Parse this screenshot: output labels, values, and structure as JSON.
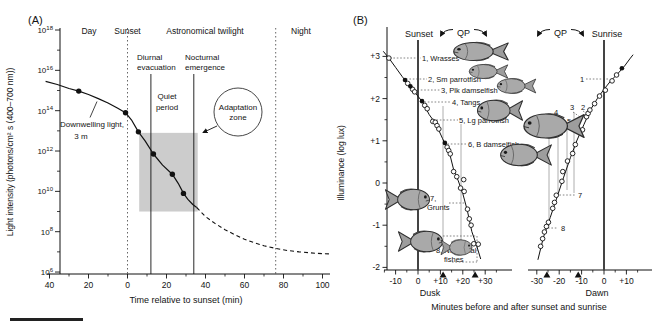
{
  "figure": {
    "panel_a_tag": "(A)",
    "panel_b_tag": "(B)"
  },
  "chart_data": [
    {
      "panel": "A",
      "type": "line",
      "xlabel": "Time relative to sunset (min)",
      "ylabel": "Light intensity (photons/cm² s (400–700 nm))",
      "x_ticks": {
        "values": [
          -40,
          -20,
          0,
          20,
          40,
          60,
          80,
          100
        ],
        "labels": [
          "40",
          "20",
          "0",
          "20",
          "40",
          "60",
          "80",
          "100"
        ],
        "minor": [
          -30,
          -10,
          10,
          30,
          50,
          70,
          90
        ]
      },
      "y_ticks": {
        "base": "10",
        "exponents": [
          18,
          16,
          14,
          12,
          10,
          8,
          6
        ],
        "minor_exponents": [
          17,
          15,
          13,
          11,
          9,
          7
        ]
      },
      "xlim": [
        -44,
        104
      ],
      "ylim_log10": [
        6,
        18
      ],
      "top_band_labels": {
        "day": "Day",
        "sunset": "Sunset",
        "astronomical_twilight": "Astronomical twilight",
        "night": "Night"
      },
      "boundaries": {
        "sunset_dotted_t": 0,
        "night_dotted_t": 76,
        "diurnal_evacuation_line_t": 12,
        "nocturnal_emergence_line_t": 34
      },
      "quiet_period_box": {
        "t_range": [
          6,
          36
        ],
        "log10_range": [
          9.0,
          12.9
        ]
      },
      "series": [
        {
          "name": "Downwelling light, 3 m (measured)",
          "style": "solid",
          "points": [
            [
              -42,
              15.45
            ],
            [
              -36,
              15.3
            ],
            [
              -30,
              15.1
            ],
            [
              -25,
              14.97
            ],
            [
              -20,
              14.8
            ],
            [
              -15,
              14.6
            ],
            [
              -10,
              14.38
            ],
            [
              -5,
              14.12
            ],
            [
              -1,
              13.9
            ],
            [
              2,
              13.55
            ],
            [
              5.6,
              12.95
            ],
            [
              9,
              12.5
            ],
            [
              13.3,
              11.85
            ],
            [
              18,
              11.3
            ],
            [
              23,
              10.85
            ],
            [
              26,
              10.4
            ],
            [
              28.7,
              9.9
            ],
            [
              31,
              9.6
            ],
            [
              33.5,
              9.35
            ],
            [
              35.5,
              9.2
            ]
          ]
        },
        {
          "name": "extrapolated",
          "style": "dashed",
          "points": [
            [
              35.5,
              9.2
            ],
            [
              40,
              8.75
            ],
            [
              45,
              8.4
            ],
            [
              50,
              8.1
            ],
            [
              55,
              7.85
            ],
            [
              60,
              7.63
            ],
            [
              65,
              7.45
            ],
            [
              70,
              7.3
            ],
            [
              76,
              7.17
            ],
            [
              82,
              7.07
            ],
            [
              88,
              7.0
            ],
            [
              94,
              6.95
            ],
            [
              100,
              6.91
            ],
            [
              103.5,
              6.9
            ]
          ]
        },
        {
          "name": "measurement points",
          "style": "filled-dots",
          "points": [
            [
              -25,
              14.97
            ],
            [
              -1,
              13.9
            ],
            [
              5.6,
              12.95
            ],
            [
              13.3,
              11.85
            ],
            [
              23,
              10.85
            ],
            [
              28.7,
              9.9
            ]
          ]
        }
      ],
      "annotations": {
        "diurnal_evacuation": [
          "Diurnal",
          "evacuation"
        ],
        "nocturnal_emergence": [
          "Nocturnal",
          "emergence"
        ],
        "quiet_period": [
          "Quiet",
          "period"
        ],
        "adaptation_zone": [
          "Adaptation",
          "zone"
        ],
        "downwelling": [
          "Downwelling light,",
          "3 m"
        ]
      }
    },
    {
      "panel": "B",
      "type": "scatter",
      "ylabel": "Illuminance (log lux)",
      "xlabel": "Minutes before and after sunset and sunrise",
      "y_ticks": {
        "values": [
          3,
          2,
          1,
          0,
          -1,
          -2
        ],
        "labels": [
          "+3",
          "+2",
          "+1",
          "0",
          "-1",
          "-2"
        ],
        "minor": [
          2.5,
          1.5,
          0.5,
          -0.5,
          -1.5
        ]
      },
      "dusk": {
        "label": "Dusk",
        "header": "Sunset",
        "qp_label": "QP",
        "x_ticks": {
          "values": [
            -10,
            0,
            10,
            20,
            30
          ],
          "labels": [
            "-10",
            "0",
            "+10",
            "+20",
            "+30"
          ],
          "minor": [
            -15,
            -5,
            5,
            15,
            25,
            35
          ]
        },
        "curve": [
          [
            -15.5,
            3.12
          ],
          [
            -13,
            2.96
          ],
          [
            -10,
            2.74
          ],
          [
            -7,
            2.52
          ],
          [
            -4,
            2.32
          ],
          [
            -1,
            2.12
          ],
          [
            2,
            1.92
          ],
          [
            5,
            1.62
          ],
          [
            8,
            1.4
          ],
          [
            11,
            1.05
          ],
          [
            14,
            0.72
          ],
          [
            16,
            0.3
          ],
          [
            18,
            0.05
          ],
          [
            20,
            -0.25
          ],
          [
            22,
            -0.65
          ],
          [
            24,
            -1.15
          ],
          [
            26,
            -1.45
          ],
          [
            28,
            -1.8
          ]
        ],
        "open_points": [
          [
            -13,
            2.96
          ],
          [
            -4.6,
            2.36
          ],
          [
            -2.4,
            2.22
          ],
          [
            -1.5,
            2.16
          ],
          [
            3,
            1.84
          ],
          [
            4.1,
            1.76
          ],
          [
            6.6,
            1.46
          ],
          [
            7.7,
            1.44
          ],
          [
            8.5,
            1.36
          ],
          [
            9.3,
            1.28
          ],
          [
            13,
            0.85
          ],
          [
            13.7,
            0.77
          ],
          [
            14.4,
            0.69
          ],
          [
            15.9,
            0.27
          ],
          [
            17.3,
            0.15
          ],
          [
            19,
            -0.12
          ],
          [
            20.4,
            0.08
          ],
          [
            20.6,
            -0.2
          ],
          [
            22.1,
            -0.62
          ],
          [
            22.9,
            -0.85
          ],
          [
            23.7,
            -1.0
          ],
          [
            24.9,
            -1.44
          ],
          [
            26.9,
            -1.45
          ]
        ],
        "filled_points": [
          [
            -5.8,
            2.44
          ],
          [
            -3.4,
            2.29
          ],
          [
            1.8,
            1.94
          ],
          [
            12,
            0.95
          ]
        ],
        "qp_marker_times": [
          11.2,
          25.5
        ]
      },
      "dawn": {
        "label": "Dawn",
        "header": "Sunrise",
        "qp_label": "QP",
        "x_ticks": {
          "values": [
            -30,
            -20,
            -10,
            0,
            10
          ],
          "labels": [
            "-30",
            "-20",
            "-10",
            "0",
            "+10"
          ],
          "minor": [
            -25,
            -15,
            -5,
            5,
            15
          ]
        },
        "curve": [
          [
            -29.5,
            -1.82
          ],
          [
            -27,
            -1.28
          ],
          [
            -24,
            -0.82
          ],
          [
            -21,
            -0.34
          ],
          [
            -18,
            0.14
          ],
          [
            -15,
            0.6
          ],
          [
            -12,
            1.02
          ],
          [
            -9,
            1.38
          ],
          [
            -6,
            1.74
          ],
          [
            -3,
            2.0
          ],
          [
            0,
            2.22
          ],
          [
            3,
            2.42
          ],
          [
            6,
            2.58
          ],
          [
            9,
            2.76
          ],
          [
            11.5,
            2.94
          ],
          [
            13,
            3.04
          ]
        ],
        "open_points": [
          [
            -28.3,
            -1.5
          ],
          [
            -27.4,
            -1.32
          ],
          [
            -26.6,
            -1.16
          ],
          [
            -25.7,
            -1.03
          ],
          [
            -24.8,
            -0.93
          ],
          [
            -22.9,
            -0.6
          ],
          [
            -22.1,
            -0.46
          ],
          [
            -21.3,
            -0.29
          ],
          [
            -18.8,
            0.04
          ],
          [
            -18.4,
            0.27
          ],
          [
            -16.3,
            0.52
          ],
          [
            -14,
            0.7
          ],
          [
            -12.8,
            0.91
          ],
          [
            -9.6,
            1.26
          ],
          [
            -7.8,
            1.57
          ],
          [
            -7.1,
            1.65
          ],
          [
            -6.3,
            1.73
          ],
          [
            -4.2,
            1.88
          ],
          [
            -2,
            2.06
          ],
          [
            0.6,
            2.2
          ],
          [
            3.6,
            2.42
          ],
          [
            5.6,
            2.56
          ]
        ],
        "filled_points": [
          [
            8,
            2.72
          ]
        ],
        "qp_marker_times": [
          -25.5,
          -11.5
        ],
        "resume_numbers": [
          "1",
          "2",
          "3",
          "4",
          "5",
          "6",
          "7",
          "8"
        ]
      },
      "species": [
        "1, Wrasses",
        "2, Sm parrotfish",
        "3, Plk damselfish",
        "4, Tangs",
        "5, Lg parrotfish",
        "6, B damselfish"
      ],
      "species_grunts": [
        "7,",
        "Grunts"
      ],
      "species_nocturnal": [
        "8, Nocturnal",
        "fishes"
      ]
    }
  ]
}
